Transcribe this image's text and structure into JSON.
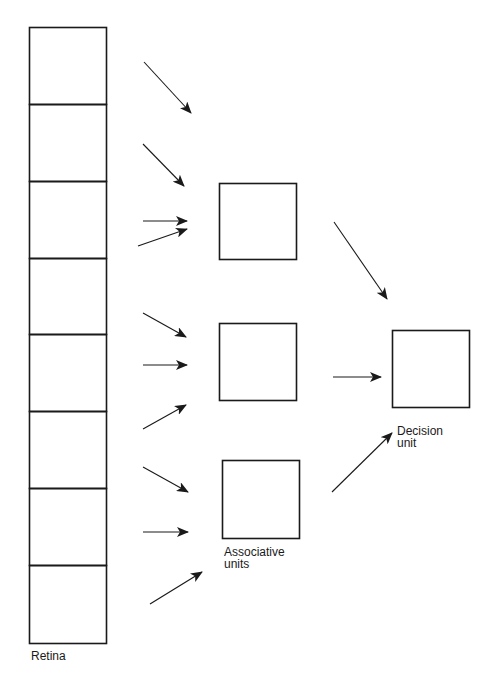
{
  "diagram": {
    "stroke_color": "#1a1a1a",
    "background": "#ffffff",
    "retina": {
      "label": "Retina",
      "x": 29,
      "width": 77,
      "cells": [
        {
          "y": 27,
          "h": 77
        },
        {
          "y": 104,
          "h": 77
        },
        {
          "y": 181,
          "h": 77
        },
        {
          "y": 258,
          "h": 76
        },
        {
          "y": 334,
          "h": 77
        },
        {
          "y": 411,
          "h": 77
        },
        {
          "y": 488,
          "h": 77
        },
        {
          "y": 565,
          "h": 78
        }
      ]
    },
    "associative_units": {
      "label_line1": "Associative",
      "label_line2": "units",
      "boxes": [
        {
          "x": 219,
          "y": 183,
          "w": 77,
          "h": 76
        },
        {
          "x": 219,
          "y": 323,
          "w": 77,
          "h": 77
        },
        {
          "x": 222,
          "y": 460,
          "w": 77,
          "h": 78
        }
      ]
    },
    "decision_unit": {
      "label_line1": "Decision",
      "label_line2": "unit",
      "box": {
        "x": 392,
        "y": 330,
        "w": 77,
        "h": 77
      }
    },
    "arrows": [
      {
        "from": [
          144,
          62
        ],
        "to": [
          191,
          113
        ],
        "target": "associative-1"
      },
      {
        "from": [
          143,
          144
        ],
        "to": [
          184,
          186
        ],
        "target": "associative-1"
      },
      {
        "from": [
          143,
          221
        ],
        "to": [
          187,
          221
        ],
        "target": "associative-1"
      },
      {
        "from": [
          138,
          246
        ],
        "to": [
          187,
          229
        ],
        "target": "associative-1"
      },
      {
        "from": [
          143,
          313
        ],
        "to": [
          186,
          337
        ],
        "target": "associative-2"
      },
      {
        "from": [
          143,
          365
        ],
        "to": [
          187,
          365
        ],
        "target": "associative-2"
      },
      {
        "from": [
          143,
          429
        ],
        "to": [
          186,
          405
        ],
        "target": "associative-2"
      },
      {
        "from": [
          143,
          467
        ],
        "to": [
          188,
          492
        ],
        "target": "associative-3"
      },
      {
        "from": [
          143,
          532
        ],
        "to": [
          188,
          532
        ],
        "target": "associative-3"
      },
      {
        "from": [
          150,
          604
        ],
        "to": [
          202,
          572
        ],
        "target": "associative-3"
      },
      {
        "from": [
          334,
          222
        ],
        "to": [
          387,
          299
        ],
        "target": "decision"
      },
      {
        "from": [
          333,
          377
        ],
        "to": [
          381,
          377
        ],
        "target": "decision"
      },
      {
        "from": [
          332,
          492
        ],
        "to": [
          392,
          433
        ],
        "target": "decision"
      }
    ]
  }
}
